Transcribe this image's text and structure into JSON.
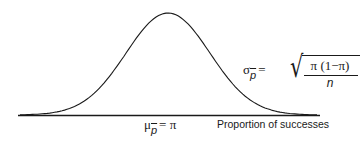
{
  "diagram": {
    "type": "normal-distribution-curve",
    "mean_label": {
      "symbol": "μ",
      "subscript": "p",
      "equals": "= π"
    },
    "x_axis_label": "Proportion of successes",
    "sd_label": {
      "symbol": "σ",
      "subscript": "p",
      "equals": "=",
      "numerator": "π (1−π)",
      "denominator": "n",
      "radical": "√"
    },
    "line_color": "#1a1a1a"
  }
}
